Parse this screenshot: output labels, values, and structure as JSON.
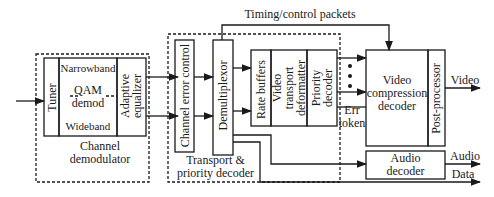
{
  "diagram": {
    "top_label": "Timing/control packets",
    "channel_demodulator": {
      "group_label_line1": "Channel",
      "group_label_line2": "demodulator",
      "tuner": "Tuner",
      "narrowband": "Narrowband",
      "qam_line1": "QAM",
      "qam_line2": "demod",
      "wideband": "Wideband",
      "equalizer_line1": "Adaptive",
      "equalizer_line2": "equalizer"
    },
    "transport_decoder": {
      "group_label_line1": "Transport &",
      "group_label_line2": "priority decoder",
      "channel_error_control": "Channel error control",
      "demultiplexor": "Demultiplexor",
      "rate_buffers": "Rate buffers",
      "video_transport_line1": "Video",
      "video_transport_line2": "transport",
      "video_transport_line3": "deformatter",
      "priority_line1": "Priority",
      "priority_line2": "decoder"
    },
    "err_token_line1": "Err",
    "err_token_line2": "token",
    "video_decoder_line1": "Video",
    "video_decoder_line2": "compression",
    "video_decoder_line3": "decoder",
    "post_processor": "Post-processor",
    "audio_decoder_line1": "Audio",
    "audio_decoder_line2": "decoder",
    "outputs": {
      "video": "Video",
      "audio": "Audio",
      "data": "Data"
    }
  }
}
